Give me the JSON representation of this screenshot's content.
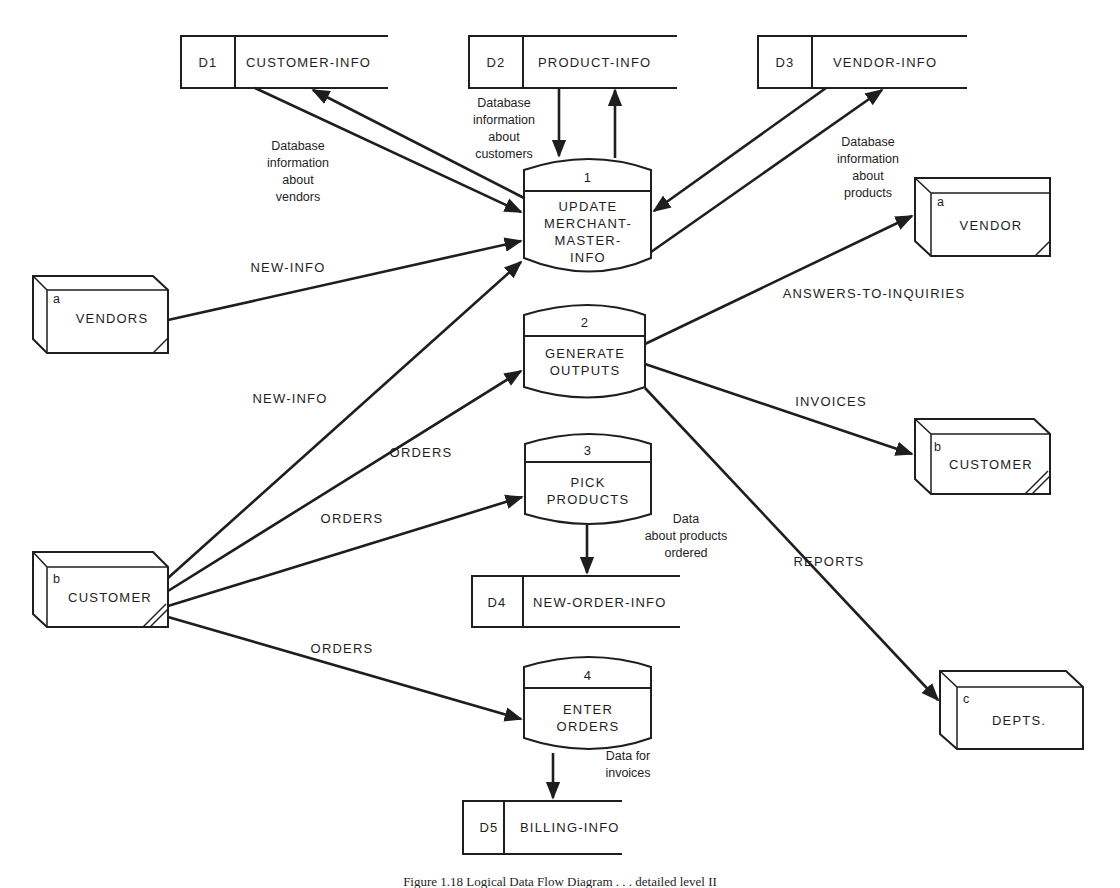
{
  "diagram": {
    "type": "logical-data-flow-diagram",
    "caption": "Figure 1.18  Logical Data Flow Diagram . . . detailed level II",
    "data_stores": [
      {
        "id": "D1",
        "name": "CUSTOMER-INFO"
      },
      {
        "id": "D2",
        "name": "PRODUCT-INFO"
      },
      {
        "id": "D3",
        "name": "VENDOR-INFO"
      },
      {
        "id": "D4",
        "name": "NEW-ORDER-INFO"
      },
      {
        "id": "D5",
        "name": "BILLING-INFO"
      }
    ],
    "processes": [
      {
        "number": "1",
        "lines": [
          "UPDATE",
          "MERCHANT-",
          "MASTER-",
          "INFO"
        ]
      },
      {
        "number": "2",
        "lines": [
          "GENERATE",
          "OUTPUTS"
        ]
      },
      {
        "number": "3",
        "lines": [
          "PICK",
          "PRODUCTS"
        ]
      },
      {
        "number": "4",
        "lines": [
          "ENTER",
          "ORDERS"
        ]
      }
    ],
    "external_entities": [
      {
        "letter": "a",
        "name": "VENDORS"
      },
      {
        "letter": "b",
        "name": "CUSTOMER"
      },
      {
        "letter": "a",
        "name": "VENDOR"
      },
      {
        "letter": "b",
        "name": "CUSTOMER"
      },
      {
        "letter": "c",
        "name": "DEPTS."
      }
    ],
    "flow_labels": {
      "d1_desc": [
        "Database",
        "information",
        "about",
        "vendors"
      ],
      "d2_desc": [
        "Database",
        "information",
        "about",
        "customers"
      ],
      "d3_desc": [
        "Database",
        "information",
        "about",
        "products"
      ],
      "vendors_new_info": "NEW-INFO",
      "customer_new_info": "NEW-INFO",
      "orders_to_p2": "ORDERS",
      "orders_to_p3": "ORDERS",
      "orders_to_p4": "ORDERS",
      "answers": "ANSWERS-TO-INQUIRIES",
      "invoices": "INVOICES",
      "reports": "REPORTS",
      "d4_desc": [
        "Data",
        "about products",
        "ordered"
      ],
      "d5_desc": [
        "Data for",
        "invoices"
      ]
    }
  }
}
